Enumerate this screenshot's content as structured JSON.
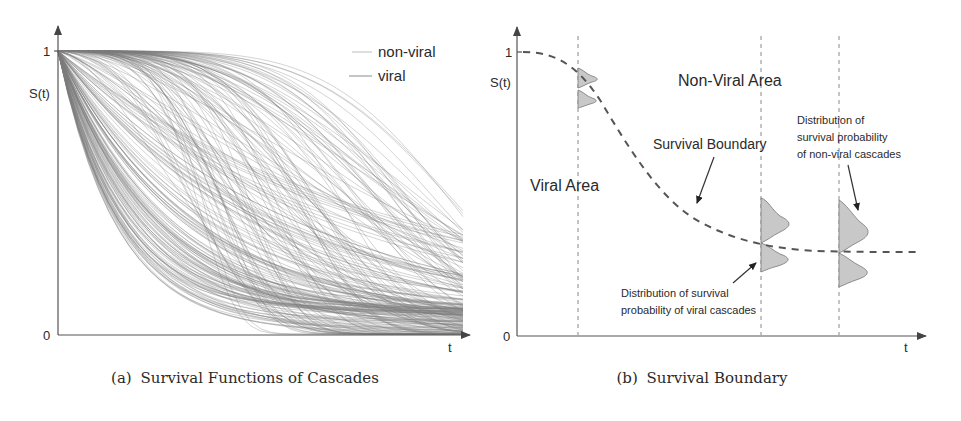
{
  "chart_data": [
    {
      "type": "line",
      "panel": "a",
      "title": "Survival Functions of Cascades",
      "caption_label": "(a)",
      "xlabel": "t",
      "ylabel": "S(t)",
      "y_ticks": [
        "0",
        "1"
      ],
      "ylim": [
        0,
        1
      ],
      "legend": [
        {
          "name": "non-viral",
          "color": "#b5b5b5"
        },
        {
          "name": "viral",
          "color": "#8a8a8a"
        }
      ],
      "legend_position": "upper right",
      "grid": false,
      "series_description": "~200 monotonically decreasing survival curves S(t) starting at S(0)=1 and decaying toward 0; some drop steeply early, others stay high then fall late",
      "curve_count": 220
    },
    {
      "type": "diagram",
      "panel": "b",
      "title": "Survival Boundary",
      "caption_label": "(b)",
      "xlabel": "t",
      "ylabel": "S(t)",
      "y_ticks": [
        "0",
        "1"
      ],
      "regions": [
        "Non-Viral Area",
        "Viral Area"
      ],
      "boundary_label": "Survival Boundary",
      "annotations": [
        "Distribution of survival probability of non-viral cascades",
        "Distribution of survival probability of viral cascades"
      ],
      "vertical_time_slices": 3
    }
  ],
  "panel_a": {
    "caption_label": "(a)",
    "caption_text": "Survival Functions of Cascades",
    "y_label": "S(t)",
    "y_tick_top": "1",
    "y_tick_bottom": "0",
    "x_label": "t",
    "legend": {
      "nonviral_label": "non-viral",
      "viral_label": "viral"
    }
  },
  "panel_b": {
    "caption_label": "(b)",
    "caption_text": "Survival Boundary",
    "y_label": "S(t)",
    "y_tick_top": "1",
    "y_tick_bottom": "0",
    "x_label": "t",
    "nonviral_area_label": "Non-Viral Area",
    "viral_area_label": "Viral Area",
    "boundary_label": "Survival Boundary",
    "nonviral_annotation": [
      "Distribution of",
      "survival probability",
      "of non-viral cascades"
    ],
    "viral_annotation": [
      "Distribution of survival",
      "probability of viral cascades"
    ]
  },
  "colors": {
    "axis": "#555555",
    "curve": "#7a7a7a",
    "distribution_fill": "#c8c8c8",
    "text": "#2a2a2a"
  }
}
